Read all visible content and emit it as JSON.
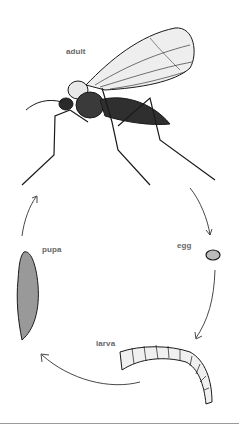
{
  "diagram": {
    "type": "life-cycle",
    "stages": [
      {
        "id": "adult",
        "label": "adult"
      },
      {
        "id": "egg",
        "label": "egg"
      },
      {
        "id": "larva",
        "label": "larva"
      },
      {
        "id": "pupa",
        "label": "pupa"
      }
    ],
    "flow": [
      "adult",
      "egg",
      "larva",
      "pupa",
      "adult"
    ],
    "colors": {
      "ink": "#1a1a1a",
      "label": "#666666",
      "separator": "#9a9a9a"
    }
  }
}
